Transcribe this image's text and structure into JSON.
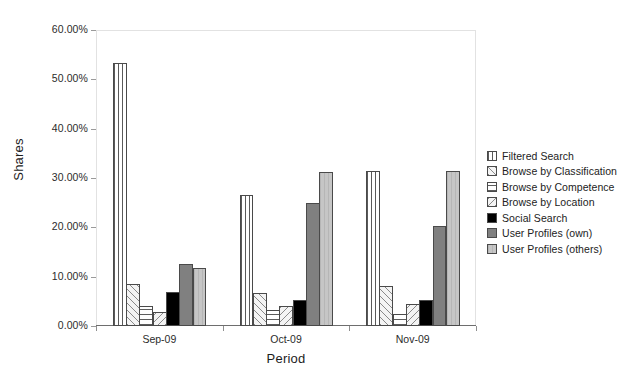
{
  "chart_data": {
    "type": "bar",
    "title": "",
    "xlabel": "Period",
    "ylabel": "Shares",
    "categories": [
      "Sep-09",
      "Oct-09",
      "Nov-09"
    ],
    "ylim": [
      0,
      60
    ],
    "ytick_labels": [
      "0.00%",
      "10.00%",
      "20.00%",
      "30.00%",
      "40.00%",
      "50.00%",
      "60.00%"
    ],
    "ytick_values": [
      0,
      10,
      20,
      30,
      40,
      50,
      60
    ],
    "grid": true,
    "legend_position": "right",
    "value_unit": "%",
    "series": [
      {
        "name": "Filtered Search",
        "pattern": "vertical-lines",
        "color": "#ffffff",
        "values": [
          53.4,
          26.5,
          31.5
        ]
      },
      {
        "name": "Browse by Classification",
        "pattern": "diagonal-hatch-forward",
        "color": "#f4f4f4",
        "values": [
          8.6,
          6.6,
          8.2
        ]
      },
      {
        "name": "Browse by Competence",
        "pattern": "horizontal-lines",
        "color": "#ffffff",
        "values": [
          4.0,
          3.2,
          2.5
        ]
      },
      {
        "name": "Browse by Location",
        "pattern": "diagonal-hatch-backward",
        "color": "#f4f4f4",
        "values": [
          2.9,
          4.0,
          4.5
        ]
      },
      {
        "name": "Social Search",
        "pattern": "solid",
        "color": "#000000",
        "values": [
          6.8,
          5.2,
          5.2
        ]
      },
      {
        "name": "User Profiles (own)",
        "pattern": "solid",
        "color": "#808080",
        "values": [
          12.5,
          25.0,
          20.3
        ]
      },
      {
        "name": "User Profiles (others)",
        "pattern": "solid-light",
        "color": "#c2c2c2",
        "values": [
          11.8,
          31.2,
          31.5
        ]
      }
    ]
  }
}
